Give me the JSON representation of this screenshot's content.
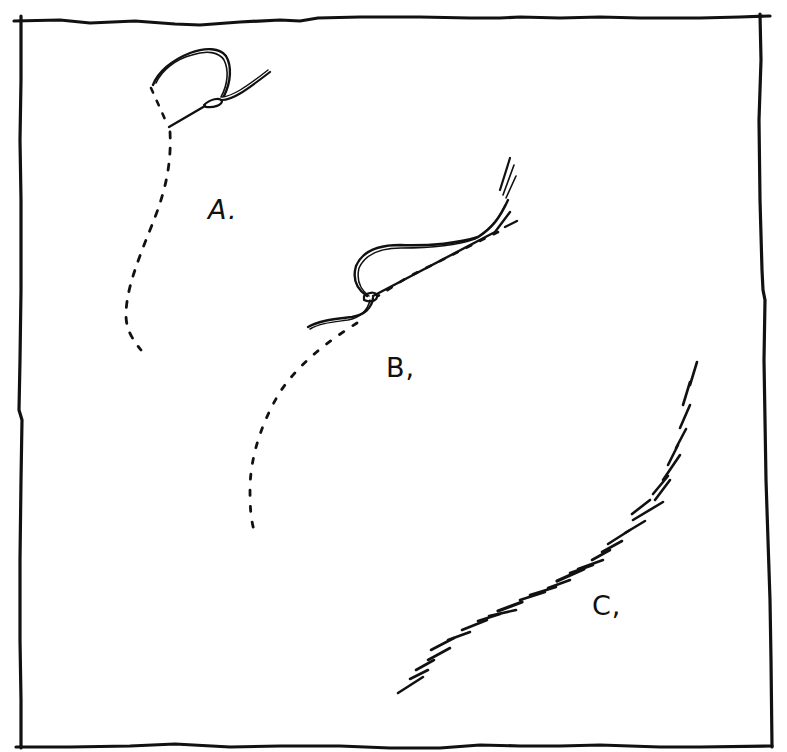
{
  "figure": {
    "kind": "hand-drawn pen illustration",
    "ink_color": "#111111",
    "background_color": "#ffffff",
    "frame": "hand-drawn rectangular border"
  },
  "panels": [
    {
      "id": "A",
      "label": "A.",
      "description": "loop of thread with knot, tail and dashed continuation curving downward"
    },
    {
      "id": "B",
      "label": "B,",
      "description": "elongated loop lying along a dashed guide line, strands rising at upper right, dashed curve continuing downward"
    },
    {
      "id": "C",
      "label": "C,",
      "description": "S-shaped curve drawn as series of overlapping short hatched strokes"
    }
  ]
}
